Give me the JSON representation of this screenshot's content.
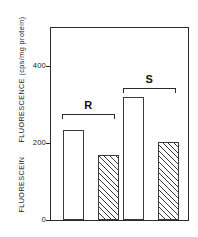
{
  "chart_data": {
    "type": "bar",
    "title": "",
    "xlabel": "",
    "ylabel": "FLUORESCEIN FLUORESCENCE (cps/mg protein)",
    "ylabel_part1": "FLUORESCEIN",
    "ylabel_part2": "FLUORESCENCE (cps/mg protein)",
    "ylim": [
      0,
      460
    ],
    "yticks": [
      0,
      200,
      400
    ],
    "ytick_labels": [
      "0",
      "200",
      "400"
    ],
    "grid": false,
    "legend": "none",
    "categories": [
      "R-open",
      "R-hatched",
      "S-open",
      "S-hatched"
    ],
    "values": [
      233,
      168,
      320,
      203
    ],
    "bars": [
      {
        "group": "R",
        "fill": "open",
        "value": 233,
        "label": ""
      },
      {
        "group": "R",
        "fill": "hatched",
        "value": 168,
        "label": ""
      },
      {
        "group": "S",
        "fill": "open",
        "value": 320,
        "label": ""
      },
      {
        "group": "S",
        "fill": "hatched",
        "value": 203,
        "label": ""
      }
    ],
    "groups": [
      {
        "label": "R",
        "bars": [
          0,
          1
        ]
      },
      {
        "label": "S",
        "bars": [
          2,
          3
        ]
      }
    ],
    "annotations": [
      {
        "text": "R",
        "type": "group-bracket"
      },
      {
        "text": "S",
        "type": "group-bracket"
      }
    ],
    "colors": {
      "axis": "#2b2b2b",
      "bar_edge": "#3a3a3a",
      "bar_fill_open": "#ffffff",
      "bar_fill_hatched": "#ffffff",
      "hatch_line": "#3a3a3a",
      "background": "#ffffff",
      "text": "#1a1a1a"
    }
  }
}
